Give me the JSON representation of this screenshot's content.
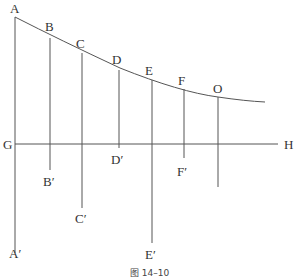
{
  "figure": {
    "caption": "图 14–10",
    "points": {
      "A": "A",
      "B": "B",
      "C": "C",
      "D": "D",
      "E": "E",
      "F": "F",
      "O": "O",
      "G": "G",
      "H": "H",
      "A_prime": "A′",
      "B_prime": "B′",
      "C_prime": "C′",
      "D_prime": "D′",
      "E_prime": "E′",
      "F_prime": "F′"
    }
  }
}
